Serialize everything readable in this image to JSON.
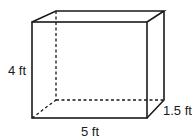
{
  "figure": {
    "type": "rectangular-prism",
    "labels": {
      "height": "4 ft",
      "width": "5 ft",
      "depth": "1.5 ft"
    },
    "colors": {
      "stroke": "#1a1a1a",
      "background": "#ffffff"
    }
  }
}
